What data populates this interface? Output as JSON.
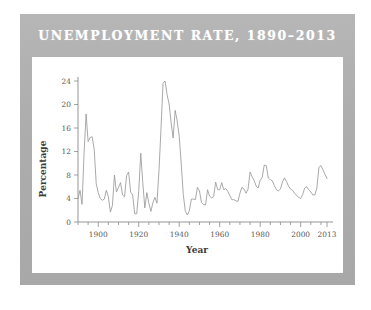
{
  "figure": {
    "title": "UNEMPLOYMENT RATE, 1890–2013",
    "band_color": "#b0b0b0",
    "panel_color": "#ffffff",
    "title_color": "#ffffff",
    "line_color": "#9a9a9a",
    "axis_color": "#8a8a8a"
  },
  "chart_data": {
    "type": "line",
    "title": "UNEMPLOYMENT RATE, 1890–2013",
    "xlabel": "Year",
    "ylabel": "Percentage",
    "xlim": [
      1890,
      2013
    ],
    "ylim": [
      0,
      24
    ],
    "yticks": [
      0,
      4,
      8,
      12,
      16,
      20,
      24
    ],
    "ytick_labels": [
      "0",
      "4",
      "8",
      "12",
      "16",
      "20",
      "24"
    ],
    "xticks": [
      1900,
      1920,
      1940,
      1960,
      1980,
      2000,
      2013
    ],
    "xtick_labels": [
      "1900",
      "1920",
      "1940",
      "1960",
      "1980",
      "2000",
      "2013"
    ],
    "xminor_step": 5,
    "grid": false,
    "legend": false,
    "series": [
      {
        "name": "Unemployment rate",
        "x": [
          1890,
          1891,
          1892,
          1893,
          1894,
          1895,
          1896,
          1897,
          1898,
          1899,
          1900,
          1901,
          1902,
          1903,
          1904,
          1905,
          1906,
          1907,
          1908,
          1909,
          1910,
          1911,
          1912,
          1913,
          1914,
          1915,
          1916,
          1917,
          1918,
          1919,
          1920,
          1921,
          1922,
          1923,
          1924,
          1925,
          1926,
          1927,
          1928,
          1929,
          1930,
          1931,
          1932,
          1933,
          1934,
          1935,
          1936,
          1937,
          1938,
          1939,
          1940,
          1941,
          1942,
          1943,
          1944,
          1945,
          1946,
          1947,
          1948,
          1949,
          1950,
          1951,
          1952,
          1953,
          1954,
          1955,
          1956,
          1957,
          1958,
          1959,
          1960,
          1961,
          1962,
          1963,
          1964,
          1965,
          1966,
          1967,
          1968,
          1969,
          1970,
          1971,
          1972,
          1973,
          1974,
          1975,
          1976,
          1977,
          1978,
          1979,
          1980,
          1981,
          1982,
          1983,
          1984,
          1985,
          1986,
          1987,
          1988,
          1989,
          1990,
          1991,
          1992,
          1993,
          1994,
          1995,
          1996,
          1997,
          1998,
          1999,
          2000,
          2001,
          2002,
          2003,
          2004,
          2005,
          2006,
          2007,
          2008,
          2009,
          2010,
          2011,
          2012,
          2013
        ],
        "y": [
          4.0,
          5.4,
          3.0,
          11.7,
          18.4,
          13.7,
          14.4,
          14.5,
          12.4,
          6.5,
          5.0,
          4.0,
          3.7,
          3.9,
          5.4,
          4.3,
          1.7,
          2.8,
          8.0,
          5.1,
          5.9,
          6.7,
          4.6,
          4.3,
          7.9,
          8.5,
          5.1,
          4.6,
          1.4,
          1.4,
          5.2,
          11.7,
          6.7,
          2.4,
          5.0,
          3.2,
          1.8,
          3.3,
          4.2,
          3.2,
          8.7,
          15.9,
          23.6,
          24.9,
          21.7,
          20.1,
          16.9,
          14.3,
          19.0,
          17.2,
          14.6,
          9.9,
          4.7,
          1.9,
          1.2,
          1.9,
          3.9,
          3.9,
          3.8,
          5.9,
          5.3,
          3.3,
          3.0,
          2.9,
          5.5,
          4.4,
          4.1,
          4.3,
          6.8,
          5.5,
          5.5,
          6.7,
          5.5,
          5.7,
          5.2,
          4.5,
          3.8,
          3.8,
          3.6,
          3.5,
          4.9,
          5.9,
          5.6,
          4.9,
          5.6,
          8.5,
          7.7,
          7.1,
          6.1,
          5.8,
          7.1,
          7.6,
          9.7,
          9.6,
          7.5,
          7.2,
          7.0,
          6.2,
          5.5,
          5.3,
          5.6,
          6.8,
          7.5,
          6.9,
          6.1,
          5.6,
          5.4,
          4.9,
          4.5,
          4.2,
          4.0,
          4.7,
          5.8,
          6.0,
          5.5,
          5.1,
          4.6,
          4.6,
          5.8,
          9.3,
          9.6,
          8.9,
          8.1,
          7.4
        ]
      }
    ]
  }
}
